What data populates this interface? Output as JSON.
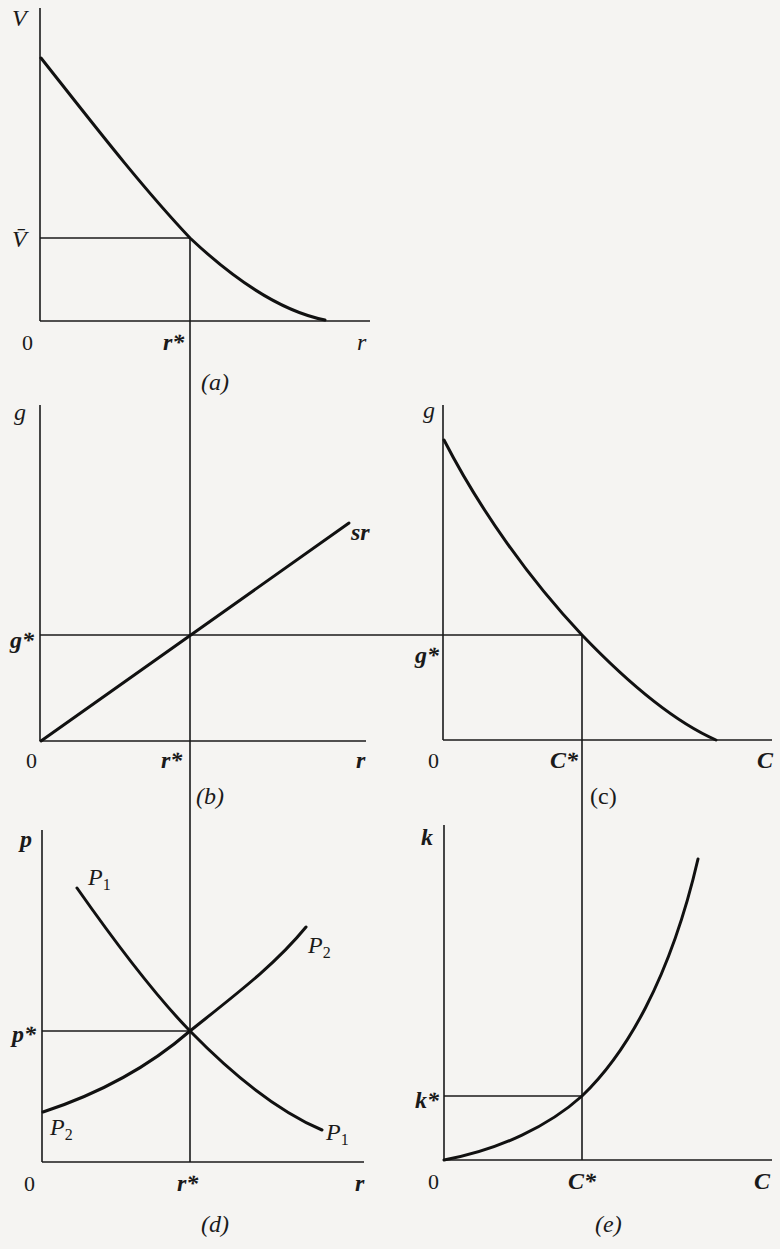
{
  "figure": {
    "panels": [
      {
        "id": "a",
        "caption": "(a)",
        "y_axis_label": "V",
        "x_axis_label": "r",
        "origin_label": "0",
        "y_star_label": "V̄",
        "x_star_label": "r*",
        "curve": "downward-sloping convex curve V(r)"
      },
      {
        "id": "b",
        "caption": "(b)",
        "y_axis_label": "g",
        "x_axis_label": "r",
        "origin_label": "0",
        "y_star_label": "g*",
        "x_star_label": "r*",
        "curve_label": "sr",
        "curve": "straight line through origin g = sr"
      },
      {
        "id": "c",
        "caption": "(c)",
        "y_axis_label": "g",
        "x_axis_label": "C",
        "origin_label": "0",
        "y_star_label": "g*",
        "x_star_label": "C*",
        "curve": "downward-sloping convex curve g(C)"
      },
      {
        "id": "d",
        "caption": "(d)",
        "y_axis_label": "p",
        "x_axis_label": "r",
        "origin_label": "0",
        "y_star_label": "p*",
        "x_star_label": "r*",
        "curves": [
          {
            "label": "P",
            "subscript": "1",
            "shape": "downward-sloping"
          },
          {
            "label": "P",
            "subscript": "2",
            "shape": "upward-sloping"
          }
        ]
      },
      {
        "id": "e",
        "caption": "(e)",
        "y_axis_label": "k",
        "x_axis_label": "C",
        "origin_label": "0",
        "y_star_label": "k*",
        "x_star_label": "C*",
        "curve": "upward-sloping convex curve k(C) from origin"
      }
    ]
  },
  "labels": {
    "a": {
      "V": "V",
      "Vbar": "V̄",
      "zero": "0",
      "rstar": "r*",
      "r": "r",
      "caption": "(a)"
    },
    "b": {
      "g": "g",
      "gstar": "g*",
      "zero": "0",
      "rstar": "r*",
      "r": "r",
      "sr": "sr",
      "caption": "(b)"
    },
    "c": {
      "g": "g",
      "gstar": "g*",
      "zero": "0",
      "Cstar": "C*",
      "C": "C",
      "caption": "(c)"
    },
    "d": {
      "p": "p",
      "pstar": "p*",
      "zero": "0",
      "rstar": "r*",
      "r": "r",
      "P": "P",
      "sub1": "1",
      "sub2": "2",
      "caption": "(d)"
    },
    "e": {
      "k": "k",
      "kstar": "k*",
      "zero": "0",
      "Cstar": "C*",
      "C": "C",
      "caption": "(e)"
    }
  }
}
